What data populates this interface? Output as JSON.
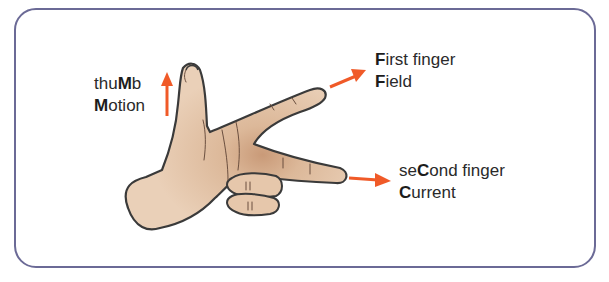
{
  "diagram": {
    "type": "illustration",
    "frame_color": "#6b6a96",
    "arrow_color": "#f05a28",
    "skin_color": "#e8cbb0",
    "outline_color": "#3a3a3a"
  },
  "labels": {
    "thumb": {
      "line1": {
        "pre": "thu",
        "bold": "M",
        "post": "b"
      },
      "line2": {
        "pre": "",
        "bold": "M",
        "post": "otion"
      },
      "arrow_direction": "up"
    },
    "first_finger": {
      "line1": {
        "pre": "",
        "bold": "F",
        "post": "irst finger"
      },
      "line2": {
        "pre": "",
        "bold": "F",
        "post": "ield"
      },
      "arrow_direction": "up-right"
    },
    "second_finger": {
      "line1": {
        "pre": "se",
        "bold": "C",
        "post": "ond finger"
      },
      "line2": {
        "pre": "",
        "bold": "C",
        "post": "urrent"
      },
      "arrow_direction": "right"
    }
  }
}
